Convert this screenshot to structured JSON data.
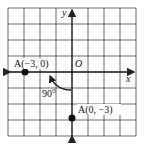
{
  "diagram": {
    "type": "coordinate-rotation",
    "grid": {
      "cols": 8,
      "rows": 8
    },
    "axes": {
      "x_label": "x",
      "y_label": "y",
      "origin_label": "O"
    },
    "points": [
      {
        "name": "A",
        "label": "A(−3, 0)",
        "x": -3,
        "y": 0
      },
      {
        "name": "A",
        "label": "A(0, −3)",
        "x": 0,
        "y": -3
      }
    ],
    "rotation": {
      "angle_label": "90°",
      "direction": "clockwise"
    },
    "colors": {
      "line": "#222222",
      "background": "#ffffff"
    }
  }
}
